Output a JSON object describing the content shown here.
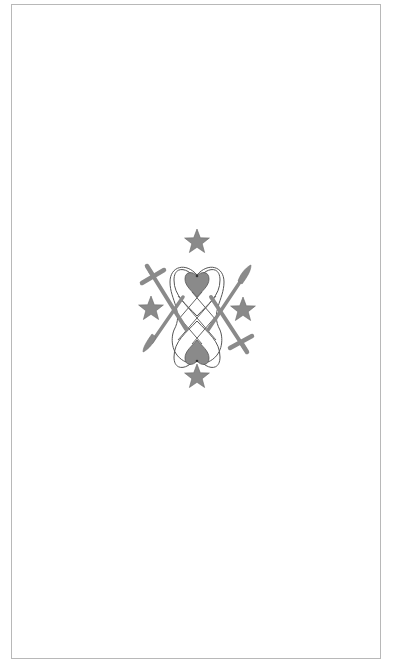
{
  "image": {
    "description": "Vodou veve symbol (Maman Brigitte-style) centered in a bordered white card",
    "alt_text": "Veve symbol with two crossed hearts, lattice, crosses, swords and four stars"
  },
  "symbol": {
    "name": "veve",
    "elements": [
      "star-top",
      "star-left",
      "star-right",
      "star-bottom",
      "heart-top",
      "heart-bottom",
      "looped-heart-outline",
      "diamond-lattice",
      "cross-left",
      "cross-right",
      "sword-left",
      "sword-right"
    ]
  },
  "colors": {
    "background": "#ffffff",
    "border": "#b8b8b8",
    "fill": "#8a8a8a",
    "outline": "#555555",
    "line": "#666666"
  }
}
